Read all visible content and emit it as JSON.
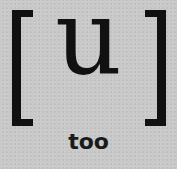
{
  "card": {
    "symbol": "u",
    "word": "too",
    "bracket_left": "[",
    "bracket_right": "]",
    "colors": {
      "background": "#c9c9c9",
      "ink": "#111111"
    }
  }
}
